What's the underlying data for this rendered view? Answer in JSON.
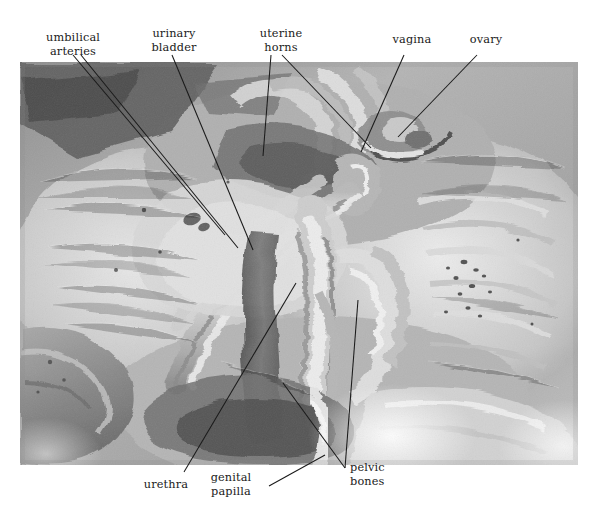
{
  "figure": {
    "type": "anatomical-photograph",
    "photo_rect": {
      "x": 20,
      "y": 62,
      "width": 558,
      "height": 403
    },
    "canvas": {
      "width": 594,
      "height": 513
    },
    "background_color": "#ffffff",
    "label_color": "#1a1a1a",
    "leader_color": "#1a1a1a"
  },
  "labels": [
    {
      "id": "umbilical-arteries",
      "lines": [
        "umbilical",
        "arteries"
      ],
      "align": "center",
      "position": "top-left",
      "leaders": [
        {
          "from": [
            73,
            55
          ],
          "to": [
            225,
            235
          ]
        },
        {
          "from": [
            81,
            55
          ],
          "to": [
            238,
            248
          ]
        }
      ]
    },
    {
      "id": "urinary-bladder",
      "lines": [
        "urinary",
        "bladder"
      ],
      "align": "center",
      "position": "top-center-left",
      "leaders": [
        {
          "from": [
            172,
            55
          ],
          "to": [
            253,
            250
          ]
        }
      ]
    },
    {
      "id": "uterine-horns",
      "lines": [
        "uterine",
        "horns"
      ],
      "align": "center",
      "position": "top-center",
      "leaders": [
        {
          "from": [
            271,
            55
          ],
          "to": [
            263,
            156
          ]
        },
        {
          "from": [
            282,
            55
          ],
          "to": [
            371,
            148
          ]
        }
      ]
    },
    {
      "id": "vagina",
      "lines": [
        "vagina"
      ],
      "align": "center",
      "position": "top-right-center",
      "leaders": [
        {
          "from": [
            404,
            55
          ],
          "to": [
            361,
            152
          ]
        }
      ]
    },
    {
      "id": "ovary",
      "lines": [
        "ovary"
      ],
      "align": "center",
      "position": "top-right",
      "leaders": [
        {
          "from": [
            477,
            55
          ],
          "to": [
            398,
            137
          ]
        }
      ]
    },
    {
      "id": "urethra",
      "lines": [
        "urethra"
      ],
      "align": "center",
      "position": "bottom-left",
      "leaders": [
        {
          "from": [
            184,
            472
          ],
          "to": [
            296,
            283
          ]
        }
      ]
    },
    {
      "id": "genital-papilla",
      "lines": [
        "genital",
        "papilla"
      ],
      "align": "center",
      "position": "bottom-center",
      "leaders": [
        {
          "from": [
            269,
            486
          ],
          "to": [
            325,
            455
          ]
        }
      ]
    },
    {
      "id": "pelvic-bones",
      "lines": [
        "pelvic",
        "bones"
      ],
      "align": "left",
      "position": "bottom-right",
      "leaders": [
        {
          "from": [
            345,
            468
          ],
          "to": [
            283,
            383
          ]
        },
        {
          "from": [
            345,
            468
          ],
          "to": [
            358,
            300
          ]
        }
      ]
    }
  ]
}
